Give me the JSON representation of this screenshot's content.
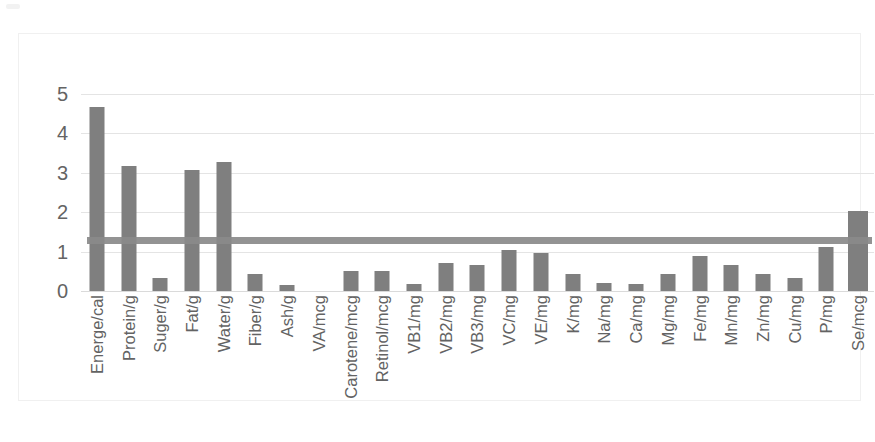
{
  "chart_data": {
    "type": "bar",
    "title": "",
    "subtitle": "",
    "xlabel": "",
    "ylabel": "",
    "ylim": [
      0,
      5
    ],
    "yticks": [
      0,
      1,
      2,
      3,
      4,
      5
    ],
    "ytick_labels": [
      "0",
      "1",
      "2",
      "3",
      "4",
      "5"
    ],
    "grid": true,
    "legend": "none",
    "categories": [
      "Energe/cal",
      "Protein/g",
      "Suger/g",
      "Fat/g",
      "Water/g",
      "Fiber/g",
      "Ash/g",
      "VA/mcg",
      "Carotene/mcg",
      "Retinol/mcg",
      "VB1/mg",
      "VB2/mg",
      "VB3/mg",
      "VC/mg",
      "VE/mg",
      "K/mg",
      "Na/mg",
      "Ca/mg",
      "Mg/mg",
      "Fe/mg",
      "Mn/mg",
      "Zn/mg",
      "Cu/mg",
      "P/mg",
      "Se/mcg"
    ],
    "series": [
      {
        "name": "value",
        "type": "bar",
        "color": "#7f7f7f",
        "values": [
          4.68,
          3.17,
          0.33,
          3.08,
          3.27,
          0.42,
          0.15,
          0.0,
          0.52,
          0.5,
          0.18,
          0.7,
          0.67,
          1.05,
          0.97,
          0.42,
          0.2,
          0.17,
          0.42,
          0.9,
          0.65,
          0.42,
          0.34,
          1.12,
          2.03
        ]
      },
      {
        "name": "reference",
        "type": "line",
        "color": "#8a8a8a",
        "constant_value": 1.28
      }
    ],
    "colors": {
      "bar": "#7f7f7f",
      "reference_line": "#8a8a8a",
      "gridline": "#e4e4e4",
      "axis_text": "#646464",
      "plot_background": "#ffffff",
      "frame_border": "#f0f0f0"
    }
  }
}
